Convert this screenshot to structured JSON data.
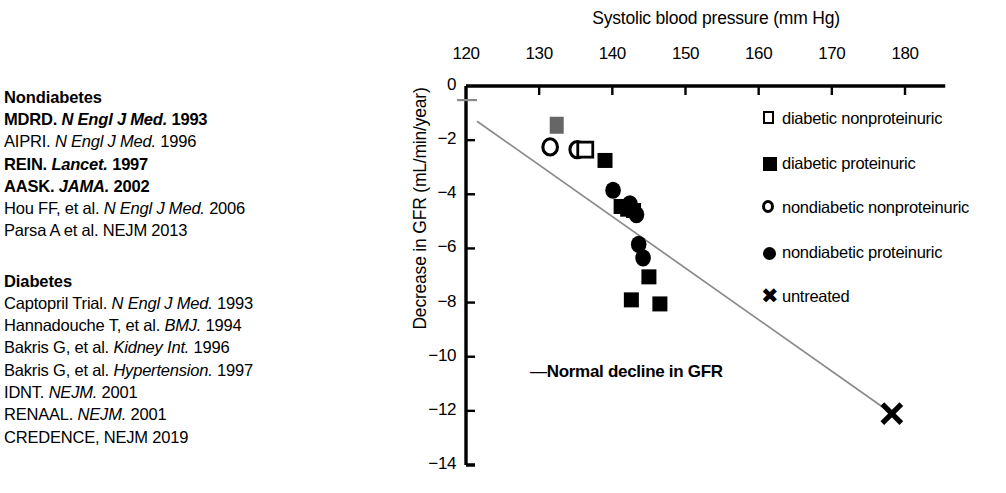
{
  "references": {
    "groups": [
      {
        "heading": "Nondiabetes",
        "entries": [
          {
            "pre": "MDRD. ",
            "journal": "N Engl J Med.",
            "post": " 1993",
            "bold": true
          },
          {
            "pre": "AIPRI. ",
            "journal": "N Engl J Med.",
            "post": " 1996",
            "bold": false
          },
          {
            "pre": "REIN. ",
            "journal": "Lancet.",
            "post": " 1997",
            "bold": true
          },
          {
            "pre": "AASK. ",
            "journal": "JAMA.",
            "post": " 2002",
            "bold": true
          },
          {
            "pre": "Hou FF, et al. ",
            "journal": "N Engl J Med.",
            "post": " 2006",
            "bold": false
          },
          {
            "pre": "Parsa A et al. NEJM 2013",
            "journal": "",
            "post": "",
            "bold": false
          }
        ]
      },
      {
        "heading": "Diabetes",
        "entries": [
          {
            "pre": "Captopril Trial. ",
            "journal": "N Engl J Med.",
            "post": " 1993",
            "bold": false
          },
          {
            "pre": "Hannadouche T, et al. ",
            "journal": "BMJ.",
            "post": " 1994",
            "bold": false
          },
          {
            "pre": "Bakris G, et al. ",
            "journal": "Kidney Int.",
            "post": " 1996",
            "bold": false
          },
          {
            "pre": "Bakris G, et al. ",
            "journal": "Hypertension.",
            "post": " 1997",
            "bold": false
          },
          {
            "pre": "IDNT. ",
            "journal": "NEJM.",
            "post": " 2001",
            "bold": false
          },
          {
            "pre": "RENAAL. ",
            "journal": "NEJM.",
            "post": " 2001",
            "bold": false
          },
          {
            "pre": "CREDENCE, NEJM 2019",
            "journal": "",
            "post": "",
            "bold": false
          }
        ]
      }
    ]
  },
  "chart_data": {
    "type": "scatter",
    "title": "",
    "xlabel": "Systolic blood pressure (mm Hg)",
    "ylabel": "Decrease in GFR (mL/min/year)",
    "xlim": [
      118,
      186
    ],
    "ylim": [
      -14,
      0
    ],
    "xticks": [
      120,
      130,
      140,
      150,
      160,
      170,
      180
    ],
    "yticks": [
      0,
      -2,
      -4,
      -6,
      -8,
      -10,
      -12,
      -14
    ],
    "xtick_labels": [
      "120",
      "130",
      "140",
      "150",
      "160",
      "170",
      "180"
    ],
    "ytick_labels": [
      "0",
      "−2",
      "−4",
      "−6",
      "−8",
      "−10",
      "−12",
      "−14"
    ],
    "grid": false,
    "legend_position": "right",
    "annotation": {
      "dash": "—",
      "text": "Normal decline in GFR",
      "x": 147,
      "y": -10.2
    },
    "trend_line": {
      "label": "Normal decline in GFR",
      "color": "#8a8a8a",
      "x_start": 121.5,
      "y_start": -1.3,
      "x_end": 178.2,
      "y_end": -12.1
    },
    "series": [
      {
        "name": "diabetic nonproteinuric",
        "marker": "open-square",
        "color": "#000000",
        "points": [
          {
            "x": 136.3,
            "y": -2.35
          }
        ]
      },
      {
        "name": "diabetic proteinuric",
        "marker": "filled-square",
        "color": "#000000",
        "points": [
          {
            "x": 139.0,
            "y": -2.75
          },
          {
            "x": 141.2,
            "y": -4.45
          },
          {
            "x": 142.1,
            "y": -4.55
          },
          {
            "x": 142.9,
            "y": -4.6
          },
          {
            "x": 142.6,
            "y": -7.9
          },
          {
            "x": 145.0,
            "y": -7.05
          },
          {
            "x": 146.5,
            "y": -8.05
          }
        ]
      },
      {
        "name": "nondiabetic nonproteinuric",
        "marker": "open-circle",
        "color": "#000000",
        "points": [
          {
            "x": 131.5,
            "y": -2.25
          },
          {
            "x": 135.2,
            "y": -2.35
          }
        ]
      },
      {
        "name": "nondiabetic proteinuric",
        "marker": "filled-circle",
        "color": "#000000",
        "points": [
          {
            "x": 140.1,
            "y": -3.85
          },
          {
            "x": 142.4,
            "y": -4.35
          },
          {
            "x": 143.3,
            "y": -4.75
          },
          {
            "x": 143.6,
            "y": -5.85
          },
          {
            "x": 144.2,
            "y": -6.35
          }
        ]
      },
      {
        "name": "untreated",
        "marker": "cross",
        "color": "#000000",
        "points": [
          {
            "x": 178.2,
            "y": -12.1
          }
        ]
      },
      {
        "name": "grey marker",
        "marker": "grey-square",
        "color": "#666666",
        "points": [
          {
            "x": 132.4,
            "y": -1.45
          }
        ]
      }
    ],
    "legend": [
      {
        "label": "diabetic nonproteinuric",
        "marker": "open-square"
      },
      {
        "label": "diabetic proteinuric",
        "marker": "filled-square"
      },
      {
        "label": "nondiabetic nonproteinuric",
        "marker": "open-circle"
      },
      {
        "label": "nondiabetic proteinuric",
        "marker": "filled-circle"
      },
      {
        "label": "untreated",
        "marker": "cross"
      }
    ]
  }
}
